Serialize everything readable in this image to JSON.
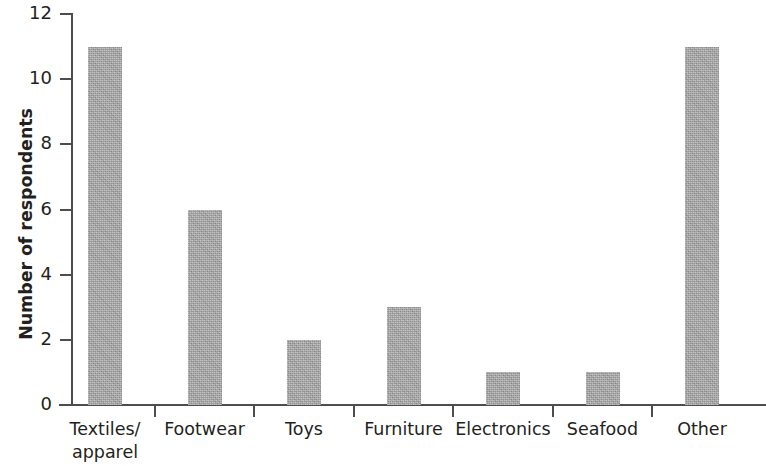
{
  "chart_data": {
    "type": "bar",
    "title": "",
    "subtitle": "",
    "xlabel": "",
    "ylabel": "Number of respondents",
    "categories": [
      "Textiles/\napparel",
      "Footwear",
      "Toys",
      "Furniture",
      "Electronics",
      "Seafood",
      "Other"
    ],
    "values": [
      11,
      6,
      2,
      3,
      1,
      1,
      11
    ],
    "ylim": [
      0,
      12
    ],
    "y_ticks": [
      "0",
      "2",
      "4",
      "6",
      "8",
      "10",
      "12"
    ],
    "y_tick_values": [
      0,
      2,
      4,
      6,
      8,
      10,
      12
    ],
    "grid": false,
    "legend": null,
    "bar_color": "#a9a9a9",
    "axis_color": "#4d4d4f",
    "text_color": "#231f20"
  }
}
